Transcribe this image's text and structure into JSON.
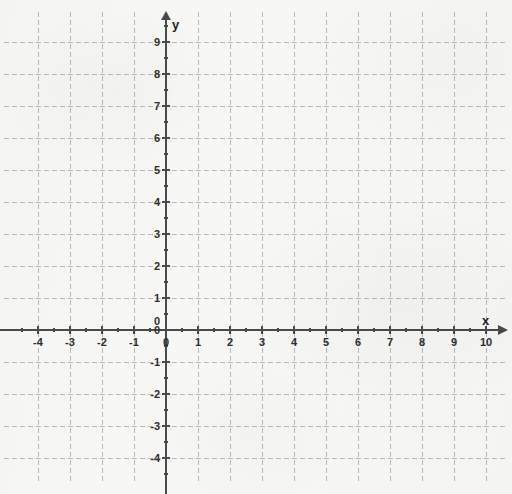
{
  "figure": {
    "background_color": "#f7f7f5",
    "axis_color": "#4a4a4a",
    "grid_color": "#b8b8b8",
    "label_color": "#2e2e2e",
    "width": 512,
    "height": 494
  },
  "axes": {
    "x_axis_label": "x",
    "y_axis_label": "y",
    "origin_label": "0",
    "x_arrow": "arrow-right",
    "y_arrow": "arrow-up"
  },
  "chart_data": {
    "type": "scatter",
    "title": "",
    "subtitle": "",
    "xlabel": "x",
    "ylabel": "y",
    "grid": true,
    "minor_ticks": true,
    "minor_tick_step": 0.5,
    "major_tick_step": 1,
    "legend": false,
    "legend_position": "none",
    "xlim": [
      -4.6,
      10.4
    ],
    "ylim": [
      -4.6,
      9.4
    ],
    "xticks": [
      -4,
      -3,
      -2,
      -1,
      0,
      1,
      2,
      3,
      4,
      5,
      6,
      7,
      8,
      9,
      10
    ],
    "yticks": [
      -4,
      -3,
      -2,
      -1,
      0,
      1,
      2,
      3,
      4,
      5,
      6,
      7,
      8,
      9
    ],
    "xtick_labels": [
      "-4",
      "-3",
      "-2",
      "-1",
      "0",
      "1",
      "2",
      "3",
      "4",
      "5",
      "6",
      "7",
      "8",
      "9",
      "10"
    ],
    "ytick_labels": [
      "-4",
      "-3",
      "-2",
      "-1",
      "0",
      "1",
      "2",
      "3",
      "4",
      "5",
      "6",
      "7",
      "8",
      "9"
    ],
    "series": [],
    "annotations": []
  }
}
